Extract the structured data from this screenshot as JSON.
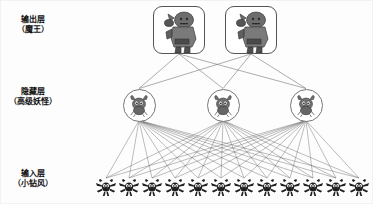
{
  "diagram": {
    "background_color": "#fdfdfd",
    "line_color": "#6b6b6b",
    "node_border_color": "#555555"
  },
  "labels": [
    {
      "name": "output-layer-label",
      "line1": "输出层",
      "line2": "（魔王）",
      "x": 16,
      "y": 14
    },
    {
      "name": "hidden-layer-label",
      "line1": "隐藏层",
      "line2": "（高级妖怪）",
      "x": 8,
      "y": 86
    },
    {
      "name": "input-layer-label",
      "line1": "输入层",
      "line2": "（小钻风）",
      "x": 12,
      "y": 168
    }
  ],
  "layers": {
    "output": {
      "label": "输出层（魔王）",
      "icon": "demon-king-icon",
      "count": 2,
      "node_shape": "rounded-rect",
      "nodes": [
        {
          "id": "out-1",
          "cx": 178,
          "cy": 29
        },
        {
          "id": "out-2",
          "cx": 250,
          "cy": 29
        }
      ]
    },
    "hidden": {
      "label": "隐藏层（高级妖怪）",
      "icon": "horned-monster-icon",
      "count": 3,
      "node_shape": "circle",
      "nodes": [
        {
          "id": "hid-1",
          "cx": 138,
          "cy": 104
        },
        {
          "id": "hid-2",
          "cx": 222,
          "cy": 104
        },
        {
          "id": "hid-3",
          "cx": 305,
          "cy": 104
        }
      ]
    },
    "input": {
      "label": "输入层（小钻风）",
      "icon": "scout-imp-icon",
      "count": 12,
      "node_shape": "sprite",
      "nodes": [
        {
          "id": "in-1",
          "cx": 105,
          "cy": 186
        },
        {
          "id": "in-2",
          "cx": 128,
          "cy": 186
        },
        {
          "id": "in-3",
          "cx": 151,
          "cy": 186
        },
        {
          "id": "in-4",
          "cx": 174,
          "cy": 186
        },
        {
          "id": "in-5",
          "cx": 197,
          "cy": 186
        },
        {
          "id": "in-6",
          "cx": 220,
          "cy": 186
        },
        {
          "id": "in-7",
          "cx": 243,
          "cy": 186
        },
        {
          "id": "in-8",
          "cx": 266,
          "cy": 186
        },
        {
          "id": "in-9",
          "cx": 289,
          "cy": 186
        },
        {
          "id": "in-10",
          "cx": 312,
          "cy": 186
        },
        {
          "id": "in-11",
          "cx": 335,
          "cy": 186
        },
        {
          "id": "in-12",
          "cx": 358,
          "cy": 186
        }
      ]
    }
  },
  "connections": {
    "output_to_hidden": "fully-connected",
    "hidden_to_input": "fully-connected"
  }
}
